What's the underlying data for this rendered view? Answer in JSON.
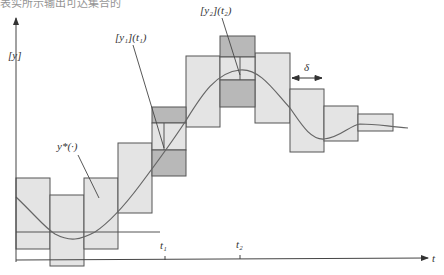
{
  "caption_fragment": "表实所示输出可达集合的",
  "colors": {
    "box_fill": "#e4e4e4",
    "box_dark_fill": "#b8b8b8",
    "stroke": "#555555",
    "curve": "#666666",
    "axis": "#444444"
  },
  "labels": {
    "y_axis": "[y]",
    "t_axis": "t",
    "t1": "t₁",
    "t2": "t₂",
    "y1_t1": "[y₁](t₁)",
    "y2_t2": "[y₂](t₂)",
    "ystar": "y*(·)",
    "delta": "δ"
  },
  "boxes": [
    {
      "x": 16,
      "y": 178,
      "w": 34,
      "h": 71
    },
    {
      "x": 50,
      "y": 195,
      "w": 34,
      "h": 71
    },
    {
      "x": 84,
      "y": 178,
      "w": 34,
      "h": 71
    },
    {
      "x": 118,
      "y": 143,
      "w": 34,
      "h": 70
    },
    {
      "x": 152,
      "y": 107,
      "w": 34,
      "h": 69
    },
    {
      "x": 186,
      "y": 56,
      "w": 34,
      "h": 71
    },
    {
      "x": 220,
      "y": 36,
      "w": 35,
      "h": 71
    },
    {
      "x": 255,
      "y": 53,
      "w": 35,
      "h": 70
    },
    {
      "x": 290,
      "y": 89,
      "w": 34,
      "h": 63
    },
    {
      "x": 324,
      "y": 106,
      "w": 34,
      "h": 35
    },
    {
      "x": 358,
      "y": 114,
      "w": 35,
      "h": 17
    }
  ],
  "highlight_boxes": [
    {
      "time": "t1",
      "x": 152,
      "top_dark": [
        107,
        123
      ],
      "light": [
        123,
        150
      ],
      "bottom_dark": [
        150,
        176
      ],
      "marker_x": 164
    },
    {
      "time": "t2",
      "x": 220,
      "top_dark": [
        36,
        57
      ],
      "light": [
        57,
        80
      ],
      "bottom_dark": [
        80,
        107
      ],
      "marker_x": 240
    }
  ]
}
